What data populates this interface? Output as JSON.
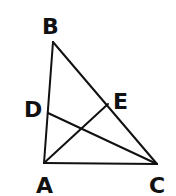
{
  "figure": {
    "type": "triangle-with-cevians",
    "stroke_color": "#111111",
    "background": "#ffffff",
    "points": {
      "A": {
        "label": "A",
        "x": 44,
        "y": 163,
        "label_x": 36,
        "label_y": 193
      },
      "B": {
        "label": "B",
        "x": 53,
        "y": 42,
        "label_x": 42,
        "label_y": 34
      },
      "C": {
        "label": "C",
        "x": 157,
        "y": 164,
        "label_x": 149,
        "label_y": 193
      },
      "D": {
        "label": "D",
        "x": 48,
        "y": 113,
        "label_x": 24,
        "label_y": 117
      },
      "E": {
        "label": "E",
        "x": 108,
        "y": 104,
        "label_x": 113,
        "label_y": 109
      }
    },
    "segments": [
      {
        "from": "A",
        "to": "B"
      },
      {
        "from": "B",
        "to": "C"
      },
      {
        "from": "A",
        "to": "C"
      },
      {
        "from": "D",
        "to": "C"
      },
      {
        "from": "A",
        "to": "E"
      }
    ]
  }
}
